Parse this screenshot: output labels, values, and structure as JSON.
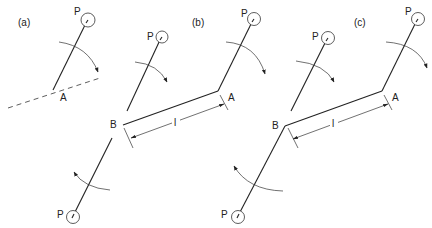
{
  "figure": {
    "colors": {
      "ink": "#222222",
      "background": "#ffffff"
    },
    "panels": [
      {
        "id": "a",
        "label": "(a)",
        "points": {
          "P": "P",
          "A": "A"
        },
        "rotation": "clockwise"
      },
      {
        "id": "b",
        "label": "(b)",
        "points": {
          "P_upper_left": "P",
          "P_upper_right": "P",
          "P_lower": "P",
          "A": "A",
          "B": "B"
        },
        "dimension": "l",
        "rotations": [
          "clockwise",
          "clockwise",
          "counterclockwise"
        ]
      },
      {
        "id": "c",
        "label": "(c)",
        "points": {
          "P_upper_left": "P",
          "P_upper_right": "P",
          "P_lower": "P",
          "A": "A",
          "B": "B"
        },
        "dimension": "l",
        "rotations": [
          "clockwise",
          "clockwise",
          "counterclockwise"
        ]
      }
    ]
  }
}
